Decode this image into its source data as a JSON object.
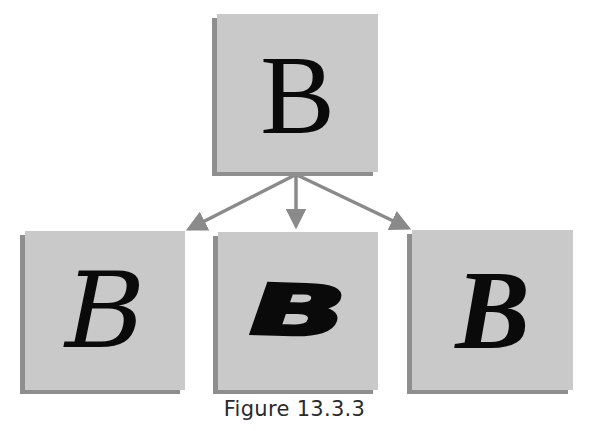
{
  "figure": {
    "caption": "Figure 13.3.3",
    "colors": {
      "box_face": "#c9c9c9",
      "box_shadow": "#8e8e8e",
      "arrow": "#8a8a8a",
      "glyph": "#0a0a0a",
      "background": "#ffffff"
    },
    "nodes": [
      {
        "id": "root",
        "label": "B",
        "style": "plain serif (abstract letter B)"
      },
      {
        "id": "child-1",
        "label": "B",
        "style": "calligraphic script"
      },
      {
        "id": "child-2",
        "label": "B",
        "style": "heavy slanted display"
      },
      {
        "id": "child-3",
        "label": "B",
        "style": "bold italic serif"
      }
    ],
    "edges": [
      {
        "from": "root",
        "to": "child-1"
      },
      {
        "from": "root",
        "to": "child-2"
      },
      {
        "from": "root",
        "to": "child-3"
      }
    ]
  }
}
